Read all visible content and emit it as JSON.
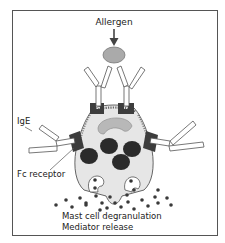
{
  "figure": {
    "labels": {
      "allergen": "Allergen",
      "ige": "IgE",
      "fc_receptor": "Fc receptor",
      "caption_line1": "Mast cell degranulation",
      "caption_line2": "Mediator release"
    },
    "colors": {
      "frame": "#555555",
      "cell_fill": "#e6e6e6",
      "cell_stroke": "#555555",
      "receptor": "#3d3d3d",
      "granule": "#2b2b2b",
      "nucleus": "#b8b8b8",
      "allergen": "#aaaaaa",
      "antibody_fill": "#ffffff",
      "antibody_stroke": "#555555",
      "mediator_dot": "#3a3a3a"
    }
  }
}
